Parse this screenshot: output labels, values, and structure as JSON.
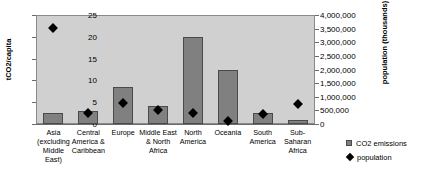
{
  "chart_data": {
    "type": "bar",
    "title": "",
    "xlabel": "",
    "ylabel": "tCO2/capita",
    "y2label": "population (thousands)",
    "ylim": [
      0,
      25
    ],
    "y2lim": [
      0,
      4000000
    ],
    "ytick_labels": [
      "0",
      "5",
      "10",
      "15",
      "20",
      "25"
    ],
    "ytick_values": [
      0,
      5,
      10,
      15,
      20,
      25
    ],
    "y2tick_labels": [
      "0",
      "500,000",
      "1,000,000",
      "1,500,000",
      "2,000,000",
      "2,500,000",
      "3,000,000",
      "3,500,000",
      "4,000,000"
    ],
    "y2tick_values": [
      0,
      500000,
      1000000,
      1500000,
      2000000,
      2500000,
      3000000,
      3500000,
      4000000
    ],
    "grid": false,
    "legend_position": "right-bottom",
    "categories": [
      "Asia (excluding Middle East)",
      "Central America & Caribbean",
      "Europe",
      "Middle East & North Africa",
      "North America",
      "Oceania",
      "South America",
      "Sub-Saharan Africa"
    ],
    "category_lines": [
      [
        "Asia",
        "(excluding",
        "Middle East)"
      ],
      [
        "Central",
        "America &",
        "Caribbean"
      ],
      [
        "Europe"
      ],
      [
        "Middle East",
        "& North",
        "Africa"
      ],
      [
        "North",
        "America"
      ],
      [
        "Oceania"
      ],
      [
        "South",
        "America"
      ],
      [
        "Sub-",
        "Saharan",
        "Africa"
      ]
    ],
    "series": [
      {
        "name": "CO2 emissions",
        "type": "bar",
        "axis": "left",
        "unit": "tCO2/capita",
        "color": "#808080",
        "values": [
          2.5,
          3.0,
          8.4,
          4.1,
          20.0,
          12.3,
          2.5,
          1.0
        ]
      },
      {
        "name": "population",
        "type": "scatter",
        "axis": "right",
        "unit": "thousands",
        "color": "#000000",
        "marker": "diamond",
        "values": [
          3520000,
          400000,
          770000,
          510000,
          390000,
          110000,
          380000,
          750000
        ]
      }
    ]
  },
  "legend": {
    "items": [
      {
        "label": "CO2 emissions",
        "marker": "square"
      },
      {
        "label": "population",
        "marker": "diamond"
      }
    ]
  }
}
